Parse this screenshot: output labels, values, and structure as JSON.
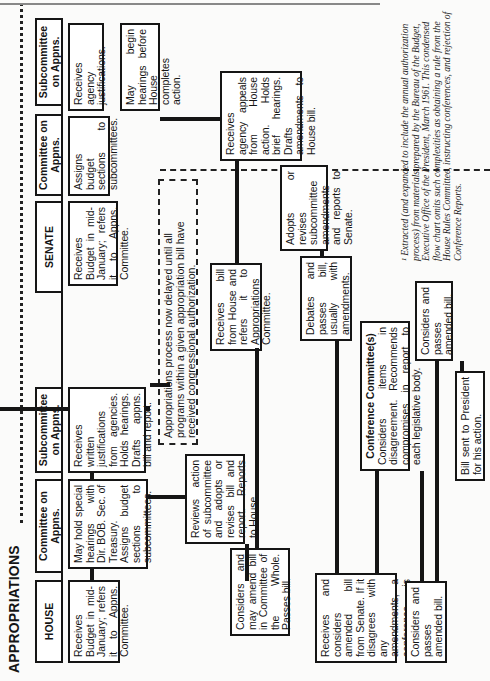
{
  "title": "APPROPRIATIONS",
  "footnote": "¹ Extracted (and expanded to include the annual authorization process) from materials prepared by the Bureau of the Budget, Executive Office of the President, March 1961. This condensed flow chart omits such complexities as obtaining a rule from the House Rules Committee, instructing conferences, and rejection of Conference Reports.",
  "headers": {
    "house": "HOUSE",
    "house_committee": "Committee on Appns.",
    "house_subcommittee": "Subcommittee on Appns.",
    "senate": "SENATE",
    "senate_committee": "Committee on Appns.",
    "senate_subcommittee": "Subcommittee on Appns."
  },
  "note": "Appropriations process now delayed until all programs within a given appropriation bill have received congressional authorization.",
  "boxes": {
    "house_receives_budget": "Receives Budget in mid-January; refers it to Appns. Committee.",
    "house_committee_hearings": "May hold special hearings with Dir. BOB. Sec. of Treasury. Assigns budget sections to subcommittees.",
    "house_subcommittee_justifications": "Receives written justifications from agencies. Holds hearings. Drafts appns. bill and report.",
    "house_committee_reviews": "Reviews action of subcommittee and adopts or revises bill and report. Reports to House.",
    "house_considers_passes": "Considers and may amend bill in Committee of the Whole. Passes bill.",
    "house_receives_amended": "Receives and considers amended bill from Senate. If it disagrees with any amendments, a conference is requested.",
    "house_passes_amended": "Considers and passes amended bill.",
    "senate_receives_budget": "Receives Budget in mid-January; refers it to Appns. Committee.",
    "senate_committee_assigns": "Assigns budget sections to subcommittees.",
    "senate_subcommittee_justifications": "Receives agency justifications.",
    "senate_subcommittee_hearings": "May begin hearings before House completes action.",
    "senate_receives_bill": "Receives bill from House and refers it to Appropriations Committee.",
    "senate_subcommittee_appeals": "Receives agency appeals from House action. Holds brief hearings. Drafts amendments to House bill.",
    "senate_committee_adopts": "Adopts or revises subcommittee amendments and reports to Senate.",
    "senate_debates": "Debates and passes bill, usually with amendments.",
    "conference_title": "Conference Committee(s)",
    "conference_body": "Considers items in disagreement. Recommends compromises in report to each legislative body.",
    "senate_passes_amended": "Considers and passes amended bill.",
    "president": "Bill sent to President for his action."
  }
}
